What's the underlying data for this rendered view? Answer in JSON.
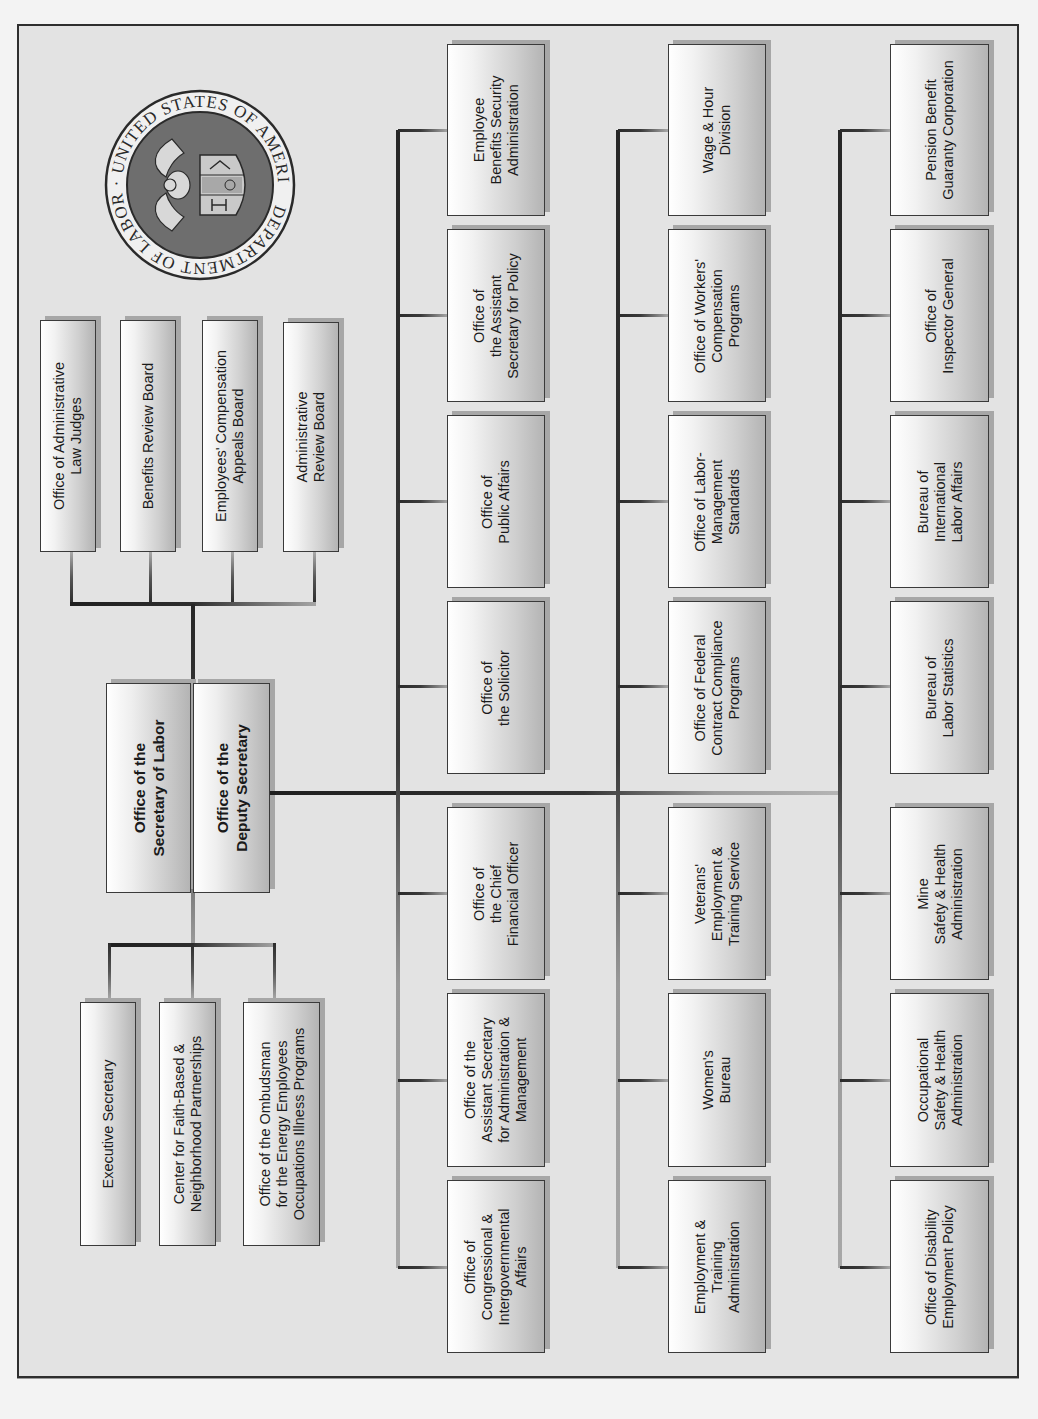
{
  "chart": {
    "orientation": "rotated -90 degrees (text reads bottom-to-top)",
    "seal": {
      "text_top": "DEPARTMENT OF LABOR",
      "text_bottom": "UNITED STATES OF AMERICA",
      "icon": "dol-seal-icon"
    },
    "central": {
      "secretary": "Office of the\nSecretary of Labor",
      "deputy": "Office of the\nDeputy Secretary"
    },
    "boards": [
      "Office of Administrative\nLaw Judges",
      "Benefits Review Board",
      "Employees' Compensation\nAppeals Board",
      "Administrative\nReview Board"
    ],
    "staff_offices": [
      "Executive Secretary",
      "Center for Faith-Based &\nNeighborhood Partnerships",
      "Office of the Ombudsman\nfor the Energy Employees\nOccupations Illness Programs"
    ],
    "column_a": [
      "Employee\nBenefits Security\nAdministration",
      "Office of\nthe Assistant\nSecretary for Policy",
      "Office of\nPublic Affairs",
      "Office of\nthe Solicitor",
      "Office of\nthe Chief\nFinancial Officer",
      "Office of the\nAssistant Secretary\nfor Administration &\nManagement",
      "Office of\nCongressional &\nIntergovernmental\nAffairs"
    ],
    "column_b": [
      "Wage & Hour\nDivision",
      "Office of Workers'\nCompensation\nPrograms",
      "Office of Labor-\nManagement\nStandards",
      "Office of Federal\nContract Compliance\nPrograms",
      "Veterans'\nEmployment &\nTraining Service",
      "Women's\nBureau",
      "Employment &\nTraining\nAdministration"
    ],
    "column_c": [
      "Pension Benefit\nGuaranty Corporation",
      "Office of\nInspector General",
      "Bureau of\nInternational\nLabor Affairs",
      "Bureau of\nLabor Statistics",
      "Mine\nSafety & Health\nAdministration",
      "Occupational\nSafety & Health\nAdministration",
      "Office of Disability\nEmployment Policy"
    ],
    "colors": {
      "background": "#e3e3e3",
      "frame_border": "#2e2e2e",
      "box_light": "#ffffff",
      "box_dark": "#b4b4b4",
      "connector": "#2d2d2d",
      "seal_field": "#6e6e6e"
    }
  }
}
